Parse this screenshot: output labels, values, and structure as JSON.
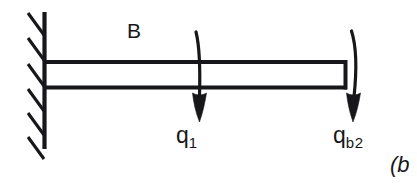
{
  "figure": {
    "kind": "engineering-beam-diagram",
    "background_color": "#ffffff",
    "ink_color": "#17171a",
    "width": 417,
    "height": 191
  },
  "labels": {
    "beam_label": "B",
    "load_1_symbol": "q",
    "load_1_subscript": "1",
    "load_2_symbol": "q",
    "load_2_subscript": "b2",
    "caption": "(b"
  },
  "elements": {
    "wall_name": "fixed-support-wall",
    "hatching_name": "support-hatching",
    "beam_name": "beam-member",
    "arrow_1_name": "load-arrow-q1",
    "arrow_2_name": "load-arrow-qb2"
  },
  "geometry": {
    "wall_x": 44,
    "wall_y_top": 12,
    "wall_y_bottom": 149,
    "hatch_count": 6,
    "beam_left": 44,
    "beam_right": 348,
    "beam_top": 61,
    "beam_bottom": 88,
    "arrow_1_x": 198,
    "arrow_2_x": 352
  }
}
